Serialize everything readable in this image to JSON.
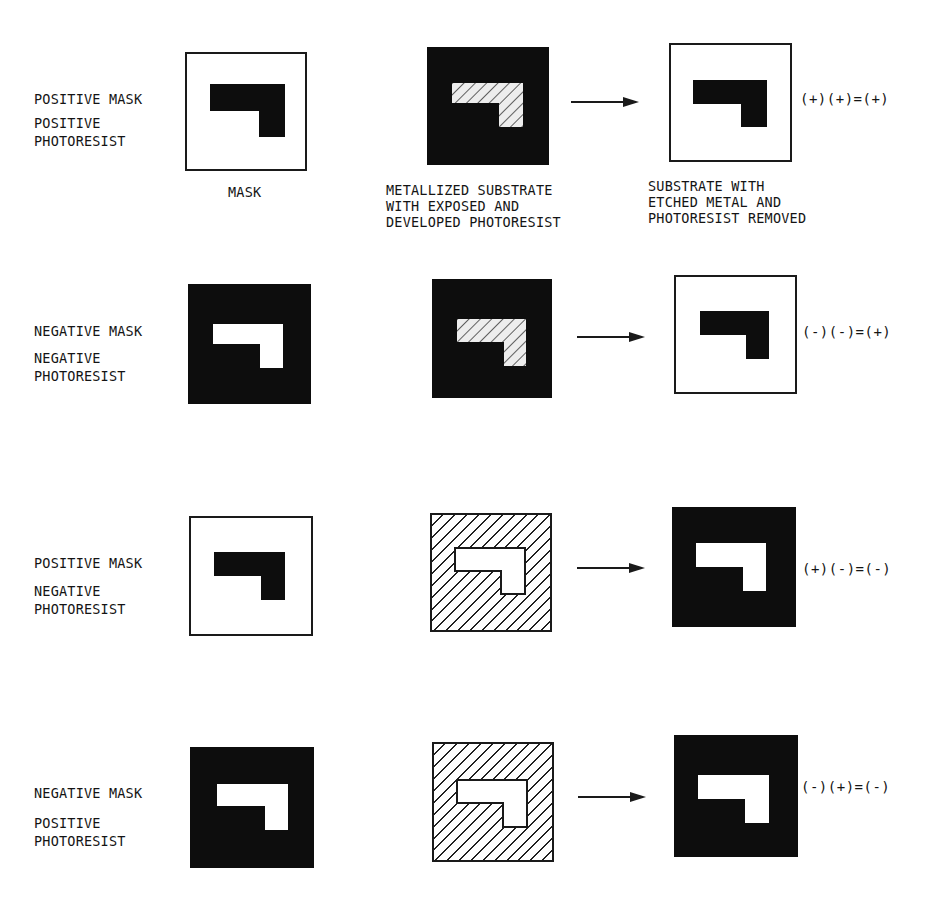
{
  "diagram": {
    "column_captions": {
      "mask": "MASK",
      "developed": "METALLIZED SUBSTRATE\nWITH EXPOSED AND\nDEVELOPED PHOTORESIST",
      "result": "SUBSTRATE WITH\nETCHED METAL AND\nPHOTORESIST REMOVED"
    },
    "rows": [
      {
        "mask_label": "POSITIVE MASK",
        "resist_label_1": "POSITIVE",
        "resist_label_2": "PHOTORESIST",
        "mask": {
          "background": "white",
          "feature": "black"
        },
        "developed": {
          "background": "black",
          "feature": "hatched"
        },
        "result": {
          "background": "white",
          "feature": "black"
        },
        "equation": "(+)(+)=(+)"
      },
      {
        "mask_label": "NEGATIVE MASK",
        "resist_label_1": "NEGATIVE",
        "resist_label_2": "PHOTORESIST",
        "mask": {
          "background": "black",
          "feature": "white"
        },
        "developed": {
          "background": "black",
          "feature": "hatched"
        },
        "result": {
          "background": "white",
          "feature": "black"
        },
        "equation": "(-)(-)=(+)"
      },
      {
        "mask_label": "POSITIVE MASK",
        "resist_label_1": "NEGATIVE",
        "resist_label_2": "PHOTORESIST",
        "mask": {
          "background": "white",
          "feature": "black"
        },
        "developed": {
          "background": "hatched",
          "feature": "white"
        },
        "result": {
          "background": "black",
          "feature": "white"
        },
        "equation": "(+)(-)=(-)"
      },
      {
        "mask_label": "NEGATIVE MASK",
        "resist_label_1": "POSITIVE",
        "resist_label_2": "PHOTORESIST",
        "mask": {
          "background": "black",
          "feature": "white"
        },
        "developed": {
          "background": "hatched",
          "feature": "white"
        },
        "result": {
          "background": "black",
          "feature": "white"
        },
        "equation": "(-)(+)=(-)"
      }
    ],
    "colors": {
      "ink": "#0d0d0d",
      "paper": "#ffffff"
    }
  }
}
